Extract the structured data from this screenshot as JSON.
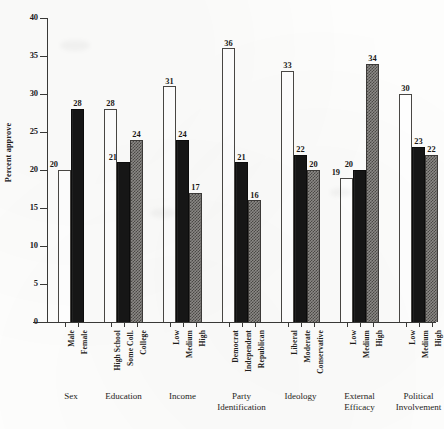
{
  "chart_data": {
    "type": "bar",
    "title": "",
    "subtitle": "",
    "xlabel": "",
    "ylabel": "Percent approve",
    "ylim": [
      0,
      40
    ],
    "ytick_values": [
      0,
      5,
      10,
      15,
      20,
      25,
      30,
      35,
      40
    ],
    "ytick_labels": [
      "0",
      "5",
      "10",
      "15",
      "20",
      "25",
      "30",
      "35",
      "40"
    ],
    "grid": false,
    "legend": "none",
    "fill_styles": {
      "white": "hollow white bar with thin black outline",
      "black": "solid black bar",
      "checker": "gray checkered / stippled bar"
    },
    "colors": {
      "white_fill": "#ffffff",
      "black_fill": "#171717",
      "checker_dark": "#4c4a47",
      "checker_light": "#8d8b88",
      "axis": "#3a3a38",
      "text": "#1f1d1b",
      "background": "#fdfdfc"
    },
    "groups": [
      {
        "name": "Sex",
        "title_lines": [
          "Sex"
        ],
        "bars": [
          {
            "label": "Male",
            "value": 20,
            "fill": "white"
          },
          {
            "label": "Female",
            "value": 28,
            "fill": "black"
          }
        ]
      },
      {
        "name": "Education",
        "title_lines": [
          "Education"
        ],
        "bars": [
          {
            "label": "High School",
            "value": 28,
            "fill": "white"
          },
          {
            "label": "Some Coll.",
            "value": 21,
            "fill": "black"
          },
          {
            "label": "College",
            "value": 24,
            "fill": "checker"
          }
        ]
      },
      {
        "name": "Income",
        "title_lines": [
          "Income"
        ],
        "bars": [
          {
            "label": "Low",
            "value": 31,
            "fill": "white"
          },
          {
            "label": "Medium",
            "value": 24,
            "fill": "black"
          },
          {
            "label": "High",
            "value": 17,
            "fill": "checker"
          }
        ]
      },
      {
        "name": "Party Identification",
        "title_lines": [
          "Party",
          "Identification"
        ],
        "bars": [
          {
            "label": "Democrat",
            "value": 36,
            "fill": "white"
          },
          {
            "label": "Independent",
            "value": 21,
            "fill": "black"
          },
          {
            "label": "Republican",
            "value": 16,
            "fill": "checker"
          }
        ]
      },
      {
        "name": "Ideology",
        "title_lines": [
          "Ideology"
        ],
        "bars": [
          {
            "label": "Liberal",
            "value": 33,
            "fill": "white"
          },
          {
            "label": "Moderate",
            "value": 22,
            "fill": "black"
          },
          {
            "label": "Conservative",
            "value": 20,
            "fill": "checker"
          }
        ]
      },
      {
        "name": "External Efficacy",
        "title_lines": [
          "External",
          "Efficacy"
        ],
        "bars": [
          {
            "label": "Low",
            "value": 19,
            "fill": "white"
          },
          {
            "label": "Medium",
            "value": 20,
            "fill": "black"
          },
          {
            "label": "High",
            "value": 34,
            "fill": "checker"
          }
        ]
      },
      {
        "name": "Political Involvement",
        "title_lines": [
          "Political",
          "Involvement"
        ],
        "bars": [
          {
            "label": "Low",
            "value": 30,
            "fill": "white"
          },
          {
            "label": "Medium",
            "value": 23,
            "fill": "black"
          },
          {
            "label": "High",
            "value": 22,
            "fill": "checker"
          }
        ]
      }
    ]
  }
}
